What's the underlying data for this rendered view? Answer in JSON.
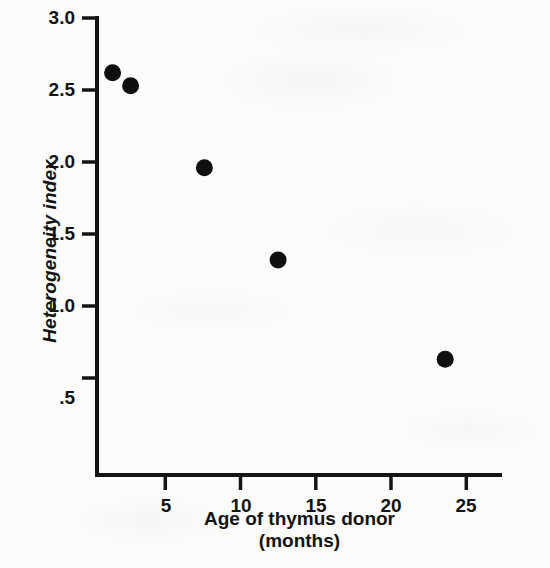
{
  "chart_data": {
    "type": "scatter",
    "title": "",
    "xlabel": "Age of thymus donor",
    "xlabel_line2": "(months)",
    "ylabel": "Heterogeneity index",
    "xlim": [
      0,
      27.5
    ],
    "ylim": [
      0,
      3.0
    ],
    "grid": false,
    "legend": null,
    "xticks": [
      5,
      10,
      15,
      20,
      25
    ],
    "xtick_labels": [
      "5",
      "10",
      "15",
      "20",
      "25"
    ],
    "yticks": [
      0.5,
      1.0,
      1.5,
      2.0,
      2.5,
      3.0
    ],
    "ytick_labels": [
      ".5",
      "1.0",
      "1.5",
      "2.0",
      "2.5",
      "3.0"
    ],
    "marker": "filled-circle",
    "marker_color": "#0f0f0f",
    "points": [
      {
        "x": 1.5,
        "y": 2.62
      },
      {
        "x": 2.7,
        "y": 2.53
      },
      {
        "x": 7.6,
        "y": 1.96
      },
      {
        "x": 12.5,
        "y": 1.32
      },
      {
        "x": 23.6,
        "y": 0.63
      }
    ],
    "series": [
      {
        "name": "Heterogeneity index vs donor age",
        "x": [
          1.5,
          2.7,
          7.6,
          12.5,
          23.6
        ],
        "values": [
          2.62,
          2.53,
          1.96,
          1.32,
          0.63
        ]
      }
    ]
  },
  "axes": {
    "axis_color": "#141414",
    "background": "#fbfbfa"
  }
}
